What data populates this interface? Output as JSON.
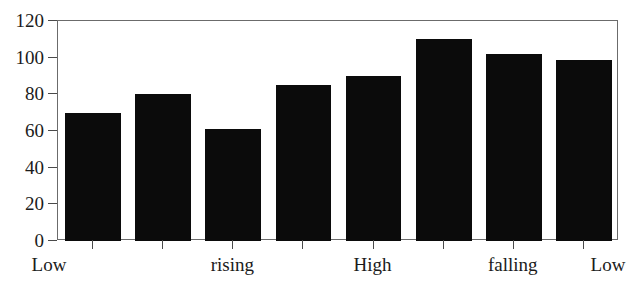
{
  "chart_data": {
    "type": "bar",
    "title": "",
    "subtitle": "",
    "xlabel": "",
    "ylabel": "",
    "ylim": [
      0,
      120
    ],
    "ytick_values": [
      0,
      20,
      40,
      60,
      80,
      100,
      120
    ],
    "ytick_labels": [
      "0",
      "20",
      "40",
      "60",
      "80",
      "100",
      "120"
    ],
    "grid": false,
    "legend": null,
    "legend_position": "none",
    "categories": [
      "Low",
      "",
      "rising",
      "",
      "High",
      "",
      "falling",
      "Low"
    ],
    "xtick_labels": [
      "Low",
      "rising",
      "High",
      "falling",
      "Low"
    ],
    "xtick_label_positions": [
      0,
      2,
      4,
      6,
      7
    ],
    "values": [
      70,
      80,
      61,
      85,
      90,
      110,
      102,
      99
    ],
    "bar_color": "#0b0b0b",
    "frame_color": "#6b6b6b",
    "axis_color": "#4a4a4a",
    "n_bars": 8
  },
  "axes": {
    "y_axis_name": "value-axis",
    "x_axis_name": "category-axis"
  }
}
